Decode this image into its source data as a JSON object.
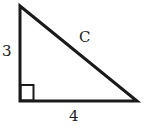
{
  "diagram": {
    "type": "right-triangle",
    "stroke_color": "#1a1a1a",
    "vertices": {
      "top": [
        20,
        6
      ],
      "right_angle": [
        20,
        101
      ],
      "bottom_right": [
        137,
        101
      ]
    },
    "right_angle_marker": true,
    "labels": {
      "vertical_leg": "3",
      "horizontal_leg": "4",
      "hypotenuse": "C"
    }
  }
}
